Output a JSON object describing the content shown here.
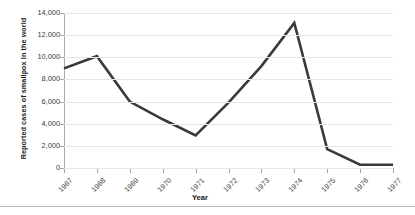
{
  "chart_data": {
    "type": "line",
    "title": "",
    "xlabel": "Year",
    "ylabel": "Reported cases of smallpox in the world",
    "categories": [
      "1967",
      "1968",
      "1969",
      "1970",
      "1971",
      "1972",
      "1973",
      "1974",
      "1975",
      "1976",
      "1977"
    ],
    "values": [
      9000,
      10100,
      6000,
      4400,
      2950,
      5900,
      9200,
      13100,
      1700,
      300,
      300
    ],
    "series": [
      {
        "name": "Reported cases of smallpox in the world",
        "values": [
          9000,
          10100,
          6000,
          4400,
          2950,
          5900,
          9200,
          13100,
          1700,
          300,
          300
        ]
      }
    ],
    "ylim": [
      0,
      14000
    ],
    "y_ticks": [
      0,
      2000,
      4000,
      6000,
      8000,
      10000,
      12000,
      14000
    ],
    "y_tick_labels": [
      "0",
      "2,000",
      "4,000",
      "6,000",
      "8,000",
      "10,000",
      "12,000",
      "14,000"
    ],
    "grid": true,
    "legend": "none",
    "line_color": "#3a3a3a",
    "grid_color": "#e6e6e6",
    "axis_color": "#a9a9a9",
    "background_color": "#ffffff"
  }
}
